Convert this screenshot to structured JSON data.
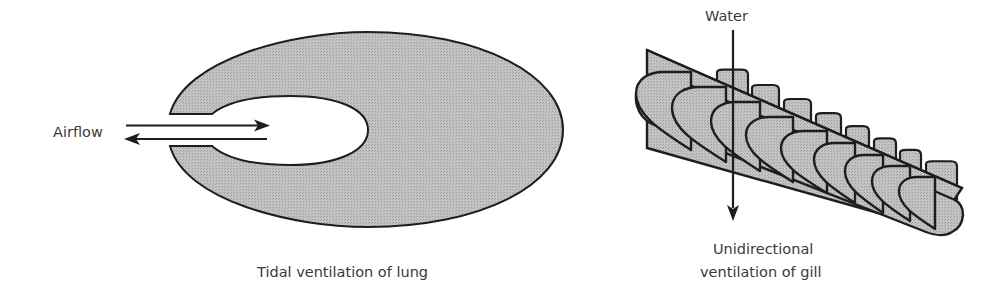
{
  "lung": {
    "caption": "Tidal ventilation of lung",
    "airflow_label": "Airflow",
    "arrows": [
      "inflow (right)",
      "outflow (left)"
    ]
  },
  "gill": {
    "water_label": "Water",
    "caption_line1": "Unidirectional",
    "caption_line2": "ventilation of gill",
    "filaments": [
      {
        "L": 636,
        "top": 72,
        "R": 691,
        "bot": 150
      },
      {
        "L": 672,
        "top": 87,
        "R": 726,
        "bot": 162
      },
      {
        "L": 711,
        "top": 102,
        "R": 760,
        "bot": 171
      },
      {
        "L": 746,
        "top": 117,
        "R": 793,
        "bot": 182
      },
      {
        "L": 781,
        "top": 131,
        "R": 827,
        "bot": 193
      },
      {
        "L": 814,
        "top": 143,
        "R": 855,
        "bot": 203
      },
      {
        "L": 845,
        "top": 155,
        "R": 883,
        "bot": 213
      },
      {
        "L": 872,
        "top": 166,
        "R": 910,
        "bot": 221
      },
      {
        "L": 899,
        "top": 177,
        "R": 935,
        "bot": 229
      }
    ],
    "back_filaments": [
      {
        "x1": 717,
        "x2": 748
      },
      {
        "x1": 752,
        "x2": 779
      },
      {
        "x1": 784,
        "x2": 811
      },
      {
        "x1": 816,
        "x2": 841
      },
      {
        "x1": 846,
        "x2": 869
      },
      {
        "x1": 874,
        "x2": 896
      },
      {
        "x1": 900,
        "x2": 921
      },
      {
        "x1": 926,
        "x2": 957
      }
    ]
  },
  "colors": {
    "fill": "#bcbcbc",
    "stroke": "#1e1e1e",
    "text": "#3a3a3a",
    "background": "#ffffff"
  }
}
